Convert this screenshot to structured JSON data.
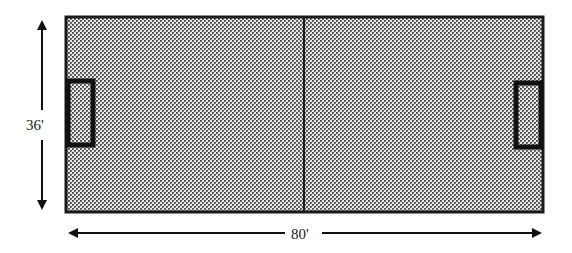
{
  "diagram": {
    "type": "field-layout",
    "field": {
      "fill_pattern": "checkered-mesh",
      "fill_dark": "#5a5a5a",
      "fill_light": "#e6e6e6",
      "border_color": "#1a1a1a"
    },
    "dimensions": {
      "width_label": "80'",
      "height_label": "36'"
    },
    "features": [
      "center-line",
      "left-goal-box",
      "right-goal-box"
    ]
  }
}
